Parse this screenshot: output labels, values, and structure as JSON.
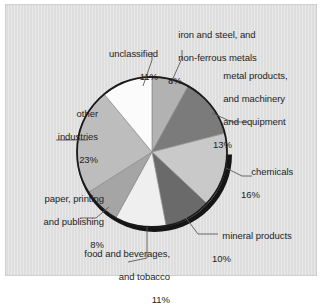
{
  "figure": {
    "panel_background": "#dedede",
    "outline_color": "#1a1a1a"
  },
  "chart_data": {
    "type": "pie",
    "title": "",
    "subtitle": "",
    "xlabel": "",
    "ylabel": "",
    "legend_position": "none",
    "grid": false,
    "units": "percent",
    "start_angle_deg": 0,
    "direction": "clockwise",
    "categories": [
      "iron and steel, and non-ferrous metals",
      "metal products, and machinery and equipment",
      "chemicals",
      "mineral products",
      "food and beverages, and tobacco",
      "paper, printing and publishing",
      "other industries",
      "unclassified"
    ],
    "values": [
      8,
      13,
      16,
      10,
      11,
      8,
      23,
      11
    ],
    "colors": [
      "#b2b2b2",
      "#7b7b7b",
      "#c9c9c9",
      "#6a6a6a",
      "#efefef",
      "#a5a5a5",
      "#bdbdbd",
      "#fbfbfb"
    ],
    "slices": [
      {
        "name": "iron-and-steel",
        "label_lines": [
          "iron and steel, and",
          "non-ferrous metals"
        ],
        "value": 8,
        "percent_label": "8%",
        "color": "#b2b2b2"
      },
      {
        "name": "metal-products",
        "label_lines": [
          "metal products,",
          "and machinery",
          "and equipment"
        ],
        "value": 13,
        "percent_label": "13%",
        "color": "#7b7b7b"
      },
      {
        "name": "chemicals",
        "label_lines": [
          "chemicals"
        ],
        "value": 16,
        "percent_label": "16%",
        "color": "#c9c9c9"
      },
      {
        "name": "mineral-products",
        "label_lines": [
          "mineral products"
        ],
        "value": 10,
        "percent_label": "10%",
        "color": "#6a6a6a"
      },
      {
        "name": "food-and-beverages",
        "label_lines": [
          "food and beverages,",
          "and tobacco"
        ],
        "value": 11,
        "percent_label": "11%",
        "color": "#efefef"
      },
      {
        "name": "paper-printing-publishing",
        "label_lines": [
          "paper, printing",
          "and publishing"
        ],
        "value": 8,
        "percent_label": "8%",
        "color": "#a5a5a5"
      },
      {
        "name": "other-industries",
        "label_lines": [
          "other",
          "industries"
        ],
        "value": 23,
        "percent_label": "23%",
        "color": "#bdbdbd"
      },
      {
        "name": "unclassified",
        "label_lines": [
          "unclassified"
        ],
        "value": 11,
        "percent_label": "11%",
        "color": "#fbfbfb"
      }
    ]
  },
  "labels": {
    "iron": {
      "l1": "iron and steel, and",
      "l2": "non-ferrous metals",
      "pct": "8%"
    },
    "metal": {
      "l1": "metal products,",
      "l2": "and machinery",
      "l3": "and equipment",
      "pct": "13%"
    },
    "chem": {
      "l1": "chemicals",
      "pct": "16%"
    },
    "mineral": {
      "l1": "mineral products",
      "pct": "10%"
    },
    "food": {
      "l1": "food and beverages,",
      "l2": "and tobacco",
      "pct": "11%"
    },
    "paper": {
      "l1": "paper, printing",
      "l2": "and publishing",
      "pct": "8%"
    },
    "other": {
      "l1": "other",
      "l2": "industries",
      "pct": "23%"
    },
    "unclass": {
      "l1": "unclassified",
      "pct": "11%"
    }
  }
}
